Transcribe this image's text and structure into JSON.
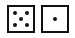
{
  "dice": [
    {
      "label": "die-1",
      "value": 5
    },
    {
      "label": "die-2",
      "value": 1
    }
  ],
  "colors": {
    "pip": "#111111",
    "border": "#111111",
    "face": "#ffffff"
  }
}
